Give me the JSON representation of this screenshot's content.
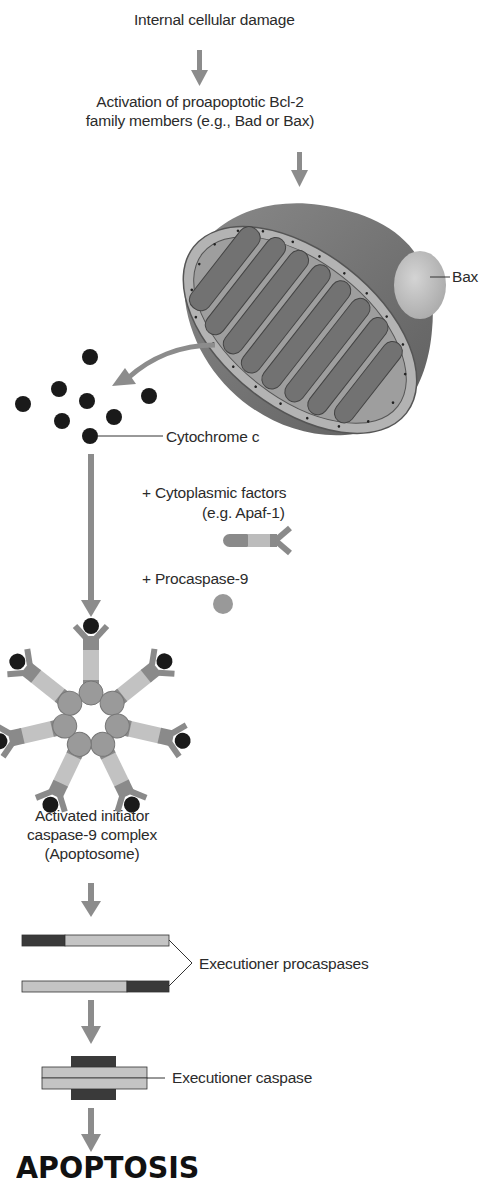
{
  "diagram": {
    "steps": {
      "damage": "Internal cellular damage",
      "activation_line1": "Activation of proapoptotic Bcl-2",
      "activation_line2": "family members (e.g., Bad or Bax)",
      "bax": "Bax",
      "cytochrome": "Cytochrome c",
      "cytoplasmic_line1": "+ Cytoplasmic factors",
      "cytoplasmic_line2": "(e.g. Apaf-1)",
      "procaspase9": "+ Procaspase-9",
      "apoptosome_line1": "Activated initiator",
      "apoptosome_line2": "caspase-9 complex",
      "apoptosome_line3": "(Apoptosome)",
      "executioner_procaspases": "Executioner procaspases",
      "executioner_caspase": "Executioner caspase",
      "outcome": "APOPTOSIS"
    },
    "colors": {
      "arrow": "#8c8c8c",
      "mito_outer": "#7a7a7a",
      "mito_inner_fill": "#9a9a9a",
      "cristae": "#6e6e6e",
      "bax": "#bdbdbd",
      "cytochrome_dot": "#1a1a1a",
      "procaspase_circle": "#9a9a9a",
      "apaf_dark": "#8a8a8a",
      "apaf_light": "#bcbcbc",
      "caspase_dark": "#3a3a3a",
      "caspase_light": "#c4c4c4"
    }
  }
}
